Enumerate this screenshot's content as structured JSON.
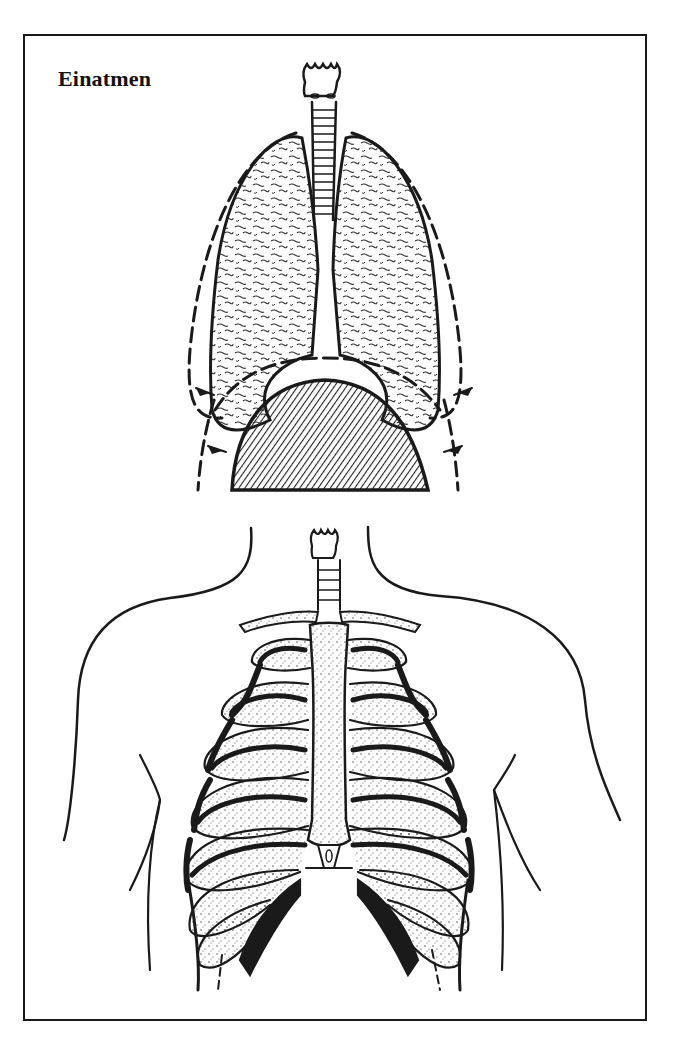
{
  "figure": {
    "title": "Einatmen",
    "panels": [
      {
        "name": "lungs-and-diaphragm",
        "description": "Lungs with trachea above domed diaphragm; dashed outlines show expanded position with arrows"
      },
      {
        "name": "ribcage-torso",
        "description": "Torso outline with sternum, clavicles and ribcage, lower ribs with dashed lines"
      }
    ],
    "colors": {
      "ink": "#1a1a1a",
      "background": "#ffffff"
    }
  }
}
